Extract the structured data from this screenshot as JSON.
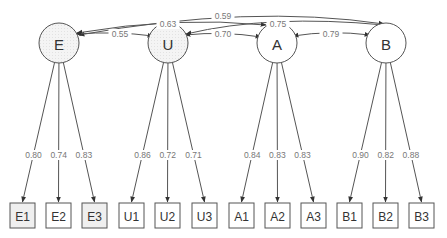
{
  "diagram": {
    "type": "structural-equation-model",
    "latent_factors": [
      {
        "id": "E",
        "label": "E",
        "cx": 59,
        "cy": 43,
        "shaded": true
      },
      {
        "id": "U",
        "label": "U",
        "cx": 168,
        "cy": 43,
        "shaded": true
      },
      {
        "id": "A",
        "label": "A",
        "cx": 277,
        "cy": 43,
        "shaded": false
      },
      {
        "id": "B",
        "label": "B",
        "cx": 386,
        "cy": 43,
        "shaded": false
      }
    ],
    "indicators": [
      {
        "id": "E1",
        "label": "E1",
        "factor": "E",
        "x": 10,
        "shaded": true
      },
      {
        "id": "E2",
        "label": "E2",
        "factor": "E",
        "x": 46,
        "shaded": false
      },
      {
        "id": "E3",
        "label": "E3",
        "factor": "E",
        "x": 82,
        "shaded": true
      },
      {
        "id": "U1",
        "label": "U1",
        "factor": "U",
        "x": 119,
        "shaded": false
      },
      {
        "id": "U2",
        "label": "U2",
        "factor": "U",
        "x": 155,
        "shaded": false
      },
      {
        "id": "U3",
        "label": "U3",
        "factor": "U",
        "x": 192,
        "shaded": false
      },
      {
        "id": "A1",
        "label": "A1",
        "factor": "A",
        "x": 229,
        "shaded": false
      },
      {
        "id": "A2",
        "label": "A2",
        "factor": "A",
        "x": 265,
        "shaded": false
      },
      {
        "id": "A3",
        "label": "A3",
        "factor": "A",
        "x": 301,
        "shaded": false
      },
      {
        "id": "B1",
        "label": "B1",
        "factor": "B",
        "x": 337,
        "shaded": false
      },
      {
        "id": "B2",
        "label": "B2",
        "factor": "B",
        "x": 373,
        "shaded": false
      },
      {
        "id": "B3",
        "label": "B3",
        "factor": "B",
        "x": 409,
        "shaded": false
      }
    ],
    "loadings": [
      {
        "from": "E",
        "to": "E1",
        "value": "0.80"
      },
      {
        "from": "E",
        "to": "E2",
        "value": "0.74"
      },
      {
        "from": "E",
        "to": "E3",
        "value": "0.83"
      },
      {
        "from": "U",
        "to": "U1",
        "value": "0.86"
      },
      {
        "from": "U",
        "to": "U2",
        "value": "0.72"
      },
      {
        "from": "U",
        "to": "U3",
        "value": "0.71"
      },
      {
        "from": "A",
        "to": "A1",
        "value": "0.84"
      },
      {
        "from": "A",
        "to": "A2",
        "value": "0.83"
      },
      {
        "from": "A",
        "to": "A3",
        "value": "0.83"
      },
      {
        "from": "B",
        "to": "B1",
        "value": "0.90"
      },
      {
        "from": "B",
        "to": "B2",
        "value": "0.82"
      },
      {
        "from": "B",
        "to": "B3",
        "value": "0.88"
      }
    ],
    "covariances": [
      {
        "between": [
          "E",
          "B"
        ],
        "value": "0.59"
      },
      {
        "between": [
          "E",
          "A"
        ],
        "value": "0.63"
      },
      {
        "between": [
          "U",
          "B"
        ],
        "value": "0.75"
      },
      {
        "between": [
          "E",
          "U"
        ],
        "value": "0.55"
      },
      {
        "between": [
          "U",
          "A"
        ],
        "value": "0.70"
      },
      {
        "between": [
          "A",
          "B"
        ],
        "value": "0.79"
      }
    ],
    "colors": {
      "stroke": "#555555",
      "label_text": "#777777",
      "node_text": "#333333",
      "shaded_fill": "#efefef",
      "plain_fill": "#ffffff"
    }
  }
}
